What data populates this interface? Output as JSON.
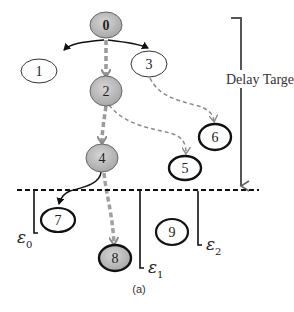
{
  "diagram": {
    "caption": "(a)",
    "delay_target_label": "Delay Target",
    "colors": {
      "gray_fill": "#b8b8b8",
      "stroke": "#111111",
      "dashed_gray": "#8a8a8a",
      "highlight_path": "#9a9a9a"
    },
    "nodes": [
      {
        "id": "0",
        "label": "0",
        "style": "gray"
      },
      {
        "id": "1",
        "label": "1",
        "style": "white-thin"
      },
      {
        "id": "2",
        "label": "2",
        "style": "gray"
      },
      {
        "id": "3",
        "label": "3",
        "style": "white-thin"
      },
      {
        "id": "4",
        "label": "4",
        "style": "gray"
      },
      {
        "id": "5",
        "label": "5",
        "style": "white-thick"
      },
      {
        "id": "6",
        "label": "6",
        "style": "white-thick"
      },
      {
        "id": "7",
        "label": "7",
        "style": "white-thick"
      },
      {
        "id": "8",
        "label": "8",
        "style": "gray-thick"
      },
      {
        "id": "9",
        "label": "9",
        "style": "white-thick"
      }
    ],
    "edges": [
      {
        "from": "0",
        "to": "1",
        "style": "solid"
      },
      {
        "from": "0",
        "to": "3",
        "style": "solid"
      },
      {
        "from": "0",
        "to": "2",
        "style": "thick-dashed"
      },
      {
        "from": "2",
        "to": "4",
        "style": "thick-dashed"
      },
      {
        "from": "2",
        "to": "5",
        "style": "dashed"
      },
      {
        "from": "3",
        "to": "6",
        "style": "dashed"
      },
      {
        "from": "4",
        "to": "7",
        "style": "solid"
      },
      {
        "from": "4",
        "to": "8",
        "style": "thick-dashed"
      }
    ],
    "epsilons": [
      {
        "symbol": "ε",
        "sub": "0"
      },
      {
        "symbol": "ε",
        "sub": "1"
      },
      {
        "symbol": "ε",
        "sub": "2"
      }
    ]
  }
}
